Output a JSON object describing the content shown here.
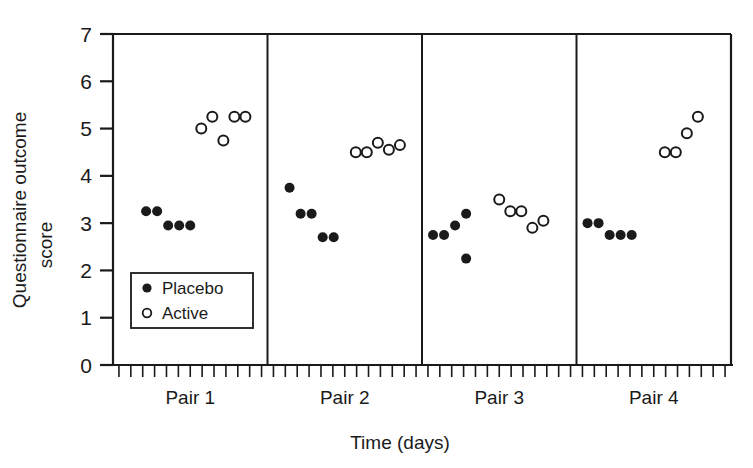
{
  "chart_data": {
    "type": "scatter",
    "title": "",
    "xlabel": "Time (days)",
    "ylabel": "Questionnaire outcome score",
    "ylabel_line1": "Questionnaire outcome",
    "ylabel_line2": "score",
    "ylim": [
      0,
      7
    ],
    "yticks": [
      0,
      1,
      2,
      3,
      4,
      5,
      6,
      7
    ],
    "ytick_labels": [
      "0",
      "1",
      "2",
      "3",
      "4",
      "5",
      "6",
      "7"
    ],
    "grid": false,
    "panel_labels": [
      "Pair 1",
      "Pair 2",
      "Pair 3",
      "Pair 4"
    ],
    "legend": {
      "position": "inside-lower-left",
      "entries": [
        {
          "name": "Placebo",
          "marker": "filled-circle",
          "color": "#1a1a1a"
        },
        {
          "name": "Active",
          "marker": "open-circle",
          "color": "#1a1a1a"
        }
      ]
    },
    "minor_ticks_per_panel": 13,
    "panels": [
      {
        "label": "Pair 1",
        "series": [
          {
            "name": "Placebo",
            "marker": "filled-circle",
            "x": [
              3.0,
              4.0,
              5.0,
              6.0,
              7.0
            ],
            "y": [
              3.25,
              3.25,
              2.95,
              2.95,
              2.95
            ]
          },
          {
            "name": "Active",
            "marker": "open-circle",
            "x": [
              8.0,
              9.0,
              10.0,
              11.0,
              12.0
            ],
            "y": [
              5.0,
              5.25,
              4.75,
              5.25,
              5.25
            ]
          }
        ]
      },
      {
        "label": "Pair 2",
        "series": [
          {
            "name": "Placebo",
            "marker": "filled-circle",
            "x": [
              2.0,
              3.0,
              4.0,
              5.0,
              6.0
            ],
            "y": [
              3.75,
              3.2,
              3.2,
              2.7,
              2.7
            ]
          },
          {
            "name": "Active",
            "marker": "open-circle",
            "x": [
              8.0,
              9.0,
              10.0,
              11.0,
              12.0
            ],
            "y": [
              4.5,
              4.5,
              4.7,
              4.55,
              4.65
            ]
          }
        ]
      },
      {
        "label": "Pair 3",
        "series": [
          {
            "name": "Placebo",
            "marker": "filled-circle",
            "x": [
              1.0,
              2.0,
              3.0,
              4.0,
              4.0
            ],
            "y": [
              2.75,
              2.75,
              2.95,
              3.2,
              2.25
            ]
          },
          {
            "name": "Active",
            "marker": "open-circle",
            "x": [
              7.0,
              8.0,
              9.0,
              10.0,
              11.0
            ],
            "y": [
              3.5,
              3.25,
              3.25,
              2.9,
              3.05
            ]
          }
        ]
      },
      {
        "label": "Pair 4",
        "series": [
          {
            "name": "Placebo",
            "marker": "filled-circle",
            "x": [
              1.0,
              2.0,
              3.0,
              4.0,
              5.0
            ],
            "y": [
              3.0,
              3.0,
              2.75,
              2.75,
              2.75
            ]
          },
          {
            "name": "Active",
            "marker": "open-circle",
            "x": [
              8.0,
              9.0,
              10.0,
              11.0
            ],
            "y": [
              4.5,
              4.5,
              4.9,
              5.25
            ]
          }
        ]
      }
    ],
    "colors": {
      "axis": "#1a1a1a",
      "placebo_fill": "#1a1a1a",
      "active_fill": "#ffffff",
      "active_stroke": "#1a1a1a",
      "background": "#ffffff"
    }
  }
}
